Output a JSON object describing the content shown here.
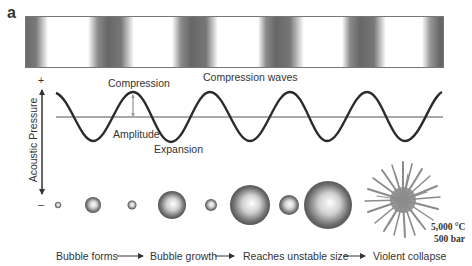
{
  "figure": {
    "panel_label": "a",
    "band": {
      "description": "compression wave density bands",
      "dark_color": "#666666",
      "light_color": "#ffffff"
    },
    "wave": {
      "title": "Compression waves",
      "peak_label": "Compression",
      "trough_label": "Expansion",
      "amplitude_label": "Amplitude",
      "line_color": "#2b2b2b",
      "baseline_color": "#555555"
    },
    "axis": {
      "label": "Acoustic Pressure",
      "plus": "+",
      "minus": "–"
    },
    "bubbles": [
      {
        "cx": 58,
        "r": 3
      },
      {
        "cx": 93,
        "r": 8
      },
      {
        "cx": 132,
        "r": 4.5
      },
      {
        "cx": 172,
        "r": 14
      },
      {
        "cx": 211,
        "r": 6
      },
      {
        "cx": 250,
        "r": 20
      },
      {
        "cx": 289,
        "r": 10
      },
      {
        "cx": 328,
        "r": 24
      }
    ],
    "collapse": {
      "temperature": "5,000 °C",
      "pressure": "500 bar"
    },
    "stages": [
      {
        "label": "Bubble forms"
      },
      {
        "label": "Bubble growth"
      },
      {
        "label": "Reaches unstable size"
      },
      {
        "label": "Violent collapse"
      }
    ],
    "arrow_icon": "right-arrow-icon"
  }
}
